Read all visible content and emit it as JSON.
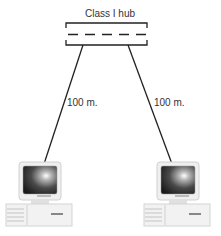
{
  "diagram": {
    "hub": {
      "label": "Class I hub"
    },
    "links": [
      {
        "label": "100 m."
      },
      {
        "label": "100 m."
      }
    ],
    "computers": [
      {
        "name": "left-computer"
      },
      {
        "name": "right-computer"
      }
    ]
  }
}
